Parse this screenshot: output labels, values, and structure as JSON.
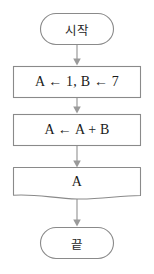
{
  "diagram": {
    "type": "flowchart",
    "orientation": "vertical",
    "colors": {
      "stroke": "#8a8a8a",
      "fill": "#ffffff",
      "text": "#1c1c1c",
      "arrow": "#9a9a9a",
      "background": "#ffffff"
    },
    "nodes": [
      {
        "id": "start",
        "shape": "terminal",
        "label": "시작"
      },
      {
        "id": "init",
        "shape": "process",
        "label": "A ← 1, B ← 7"
      },
      {
        "id": "update",
        "shape": "process",
        "label": "A ← A + B"
      },
      {
        "id": "output",
        "shape": "document",
        "label": "A"
      },
      {
        "id": "end",
        "shape": "terminal",
        "label": "끝"
      }
    ],
    "connectors": [
      {
        "id": "start-to-init",
        "from": "start",
        "to": "init",
        "arrow": "down"
      },
      {
        "id": "init-to-update",
        "from": "init",
        "to": "update",
        "arrow": "down"
      },
      {
        "id": "update-to-output",
        "from": "update",
        "to": "output",
        "arrow": "down"
      },
      {
        "id": "output-to-end",
        "from": "output",
        "to": "end",
        "arrow": "down"
      }
    ]
  }
}
